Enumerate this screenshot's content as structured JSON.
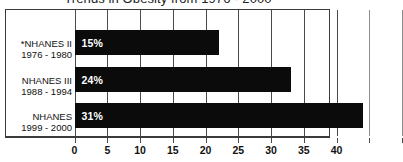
{
  "chart_data": {
    "type": "bar",
    "orientation": "horizontal",
    "title": "Trends in Obesity from 1976 - 2000",
    "xlabel": "",
    "ylabel": "",
    "categories": [
      "*NHANES II 1976 - 1980",
      "NHANES III 1988 - 1994",
      "NHANES 1999 - 2000"
    ],
    "category_lines": [
      {
        "line1": "*NHANES II",
        "line2": "1976 - 1980"
      },
      {
        "line1": "NHANES III",
        "line2": "1988 - 1994"
      },
      {
        "line1": "NHANES",
        "line2": "1999 - 2000"
      }
    ],
    "values": [
      15,
      24,
      31
    ],
    "value_labels": [
      "15%",
      "24%",
      "31%"
    ],
    "bar_lengths_on_axis": [
      22,
      33,
      44
    ],
    "xlim": [
      0,
      50
    ],
    "xticks": [
      0,
      5,
      10,
      15,
      20,
      25,
      30,
      35,
      40,
      45,
      50
    ],
    "xticklabels": [
      "0",
      "5",
      "10",
      "15",
      "20",
      "25",
      "30",
      "35",
      "40",
      "",
      ""
    ],
    "grid": true,
    "grid_axis": "x",
    "legend": false,
    "bar_color": "#0b0b0b",
    "value_label_color": "#ffffff",
    "frame_color": "#3b3b3b",
    "background_color": "#ffffff"
  }
}
